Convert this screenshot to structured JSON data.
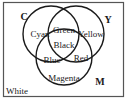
{
  "diagram": {
    "type": "venn",
    "frame": {
      "stroke": "#555555"
    },
    "circles": [
      {
        "id": "C",
        "label": "C",
        "cx": 51,
        "cy": 34,
        "r": 28,
        "label_x": 24,
        "label_y": 20
      },
      {
        "id": "Y",
        "label": "Y",
        "cx": 76,
        "cy": 34,
        "r": 28,
        "label_x": 108,
        "label_y": 23
      },
      {
        "id": "M",
        "label": "M",
        "cx": 64,
        "cy": 57,
        "r": 28,
        "label_x": 100,
        "label_y": 85
      }
    ],
    "regions": [
      {
        "name": "cyan",
        "text": "Cyan",
        "x": 40,
        "y": 37
      },
      {
        "name": "green",
        "text": "Green",
        "x": 64,
        "y": 33
      },
      {
        "name": "yellow",
        "text": "Yellow",
        "x": 91,
        "y": 37
      },
      {
        "name": "black",
        "text": "Black",
        "x": 64,
        "y": 48
      },
      {
        "name": "blue",
        "text": "Blue",
        "x": 52,
        "y": 63
      },
      {
        "name": "red",
        "text": "Red",
        "x": 81,
        "y": 61
      },
      {
        "name": "magenta",
        "text": "Magenta",
        "x": 64,
        "y": 81
      },
      {
        "name": "white",
        "text": "White",
        "x": 17,
        "y": 94
      }
    ]
  }
}
